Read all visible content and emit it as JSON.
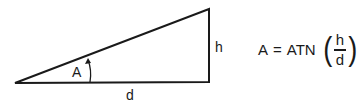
{
  "diagram": {
    "labels": {
      "angle": "A",
      "height": "h",
      "base": "d"
    },
    "formula": {
      "lhs": "A",
      "equals": "=",
      "function": "ATN",
      "numerator": "h",
      "denominator": "d"
    },
    "colors": {
      "stroke": "#1a1a1a",
      "background": "#ffffff"
    }
  }
}
